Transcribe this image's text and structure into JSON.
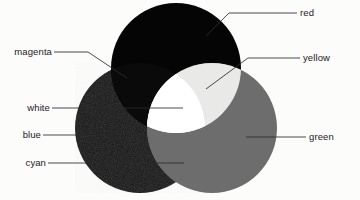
{
  "figure": {
    "background_color": "#fcfcfb",
    "top_crop_artifact": "i rendering of",
    "leader_line_color": "#2a2a2a",
    "circles": [
      {
        "id": "red",
        "label": "red",
        "cx": 176,
        "cy": 68,
        "r": 65,
        "fill": "#050505"
      },
      {
        "id": "blue",
        "label": "blue",
        "cx": 140,
        "cy": 128,
        "r": 65,
        "fill": "#100f10"
      },
      {
        "id": "green",
        "label": "green",
        "cx": 212,
        "cy": 128,
        "r": 65,
        "fill": "#6d6d6d"
      }
    ],
    "overlaps": [
      {
        "id": "magenta",
        "label": "magenta",
        "of": "red + blue",
        "fill": "#0a0a0a"
      },
      {
        "id": "yellow",
        "label": "yellow",
        "of": "red + green",
        "fill": "#e9e9e7"
      },
      {
        "id": "cyan",
        "label": "cyan",
        "of": "blue + green",
        "fill": "#6d6d6d"
      },
      {
        "id": "white",
        "label": "white",
        "of": "red + blue + green",
        "fill": "#ffffff"
      }
    ]
  },
  "labels": {
    "magenta": "magenta",
    "white": "white",
    "blue": "blue",
    "cyan": "cyan",
    "red": "red",
    "yellow": "yellow",
    "green": "green"
  }
}
